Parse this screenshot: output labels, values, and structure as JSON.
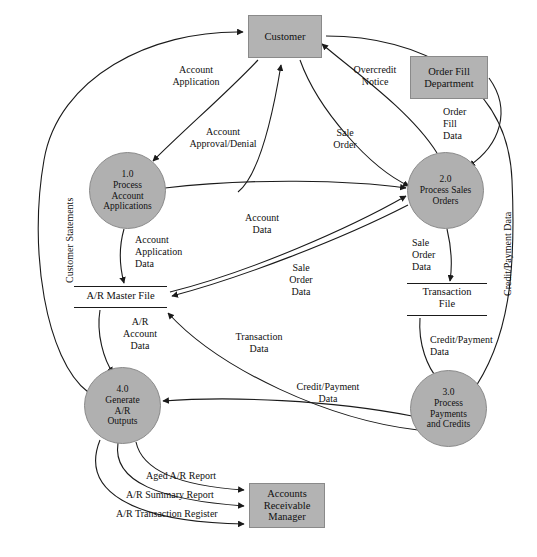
{
  "diagram": {
    "type": "data-flow-diagram",
    "colors": {
      "entity_fill": "#b3b3b3",
      "process_fill": "#b0b0b0",
      "line": "#1a1a1a",
      "text": "#101010"
    },
    "external_entities": [
      {
        "id": "customer",
        "label": "Customer"
      },
      {
        "id": "order-fill-department",
        "label": "Order Fill\nDepartment"
      },
      {
        "id": "accounts-receivable-manager",
        "label": "Accounts\nReceivable\nManager"
      }
    ],
    "processes": [
      {
        "id": "p1",
        "number": "1.0",
        "label": "1.0\nProcess\nAccount\nApplications"
      },
      {
        "id": "p2",
        "number": "2.0",
        "label": "2.0\nProcess Sales\nOrders"
      },
      {
        "id": "p3",
        "number": "3.0",
        "label": "3.0\nProcess\nPayments\nand Credits"
      },
      {
        "id": "p4",
        "number": "4.0",
        "label": "4.0\nGenerate\nA/R\nOutputs"
      }
    ],
    "data_stores": [
      {
        "id": "ar-master-file",
        "label": "A/R Master File"
      },
      {
        "id": "transaction-file",
        "label": "Transaction\nFile"
      }
    ],
    "flows": [
      {
        "id": "account-application",
        "label": "Account\nApplication"
      },
      {
        "id": "account-approval-denial",
        "label": "Account\nApproval/Denial"
      },
      {
        "id": "overcredit-notice",
        "label": "Overcredit\nNotice"
      },
      {
        "id": "sale-order",
        "label": "Sale\nOrder"
      },
      {
        "id": "order-fill-data",
        "label": "Order\nFill\nData"
      },
      {
        "id": "account-application-data",
        "label": "Account\nApplication\nData"
      },
      {
        "id": "account-data",
        "label": "Account\nData"
      },
      {
        "id": "sale-order-data-center",
        "label": "Sale\nOrder\nData"
      },
      {
        "id": "sale-order-data-right",
        "label": "Sale\nOrder\nData"
      },
      {
        "id": "ar-account-data",
        "label": "A/R\nAccount\nData"
      },
      {
        "id": "transaction-data",
        "label": "Transaction\nData"
      },
      {
        "id": "credit-payment-data-center",
        "label": "Credit/Payment\nData"
      },
      {
        "id": "credit-payment-data-right",
        "label": "Credit/Payment\nData"
      },
      {
        "id": "customer-statements",
        "label": "Customer Statements"
      },
      {
        "id": "credit-payment-data-vertical",
        "label": "Credit/Payment Data"
      },
      {
        "id": "aged-ar-report",
        "label": "Aged A/R Report"
      },
      {
        "id": "ar-summary-report",
        "label": "A/R Summary Report"
      },
      {
        "id": "ar-transaction-register",
        "label": "A/R Transaction Register"
      }
    ]
  }
}
